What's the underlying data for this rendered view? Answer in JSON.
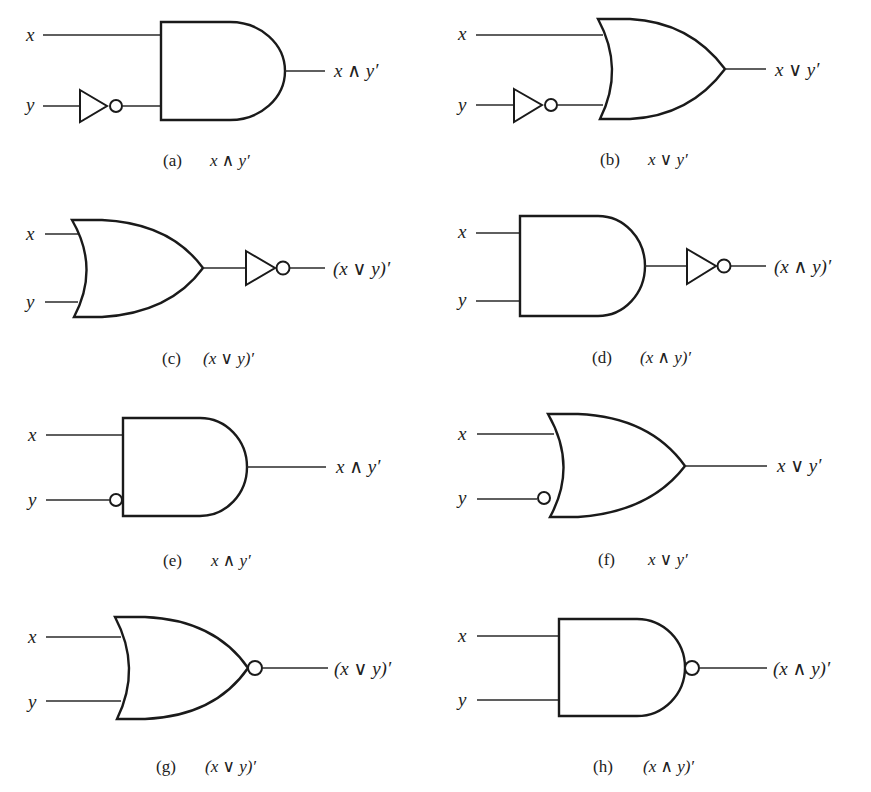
{
  "figure": {
    "panels": [
      {
        "id": "a",
        "tag": "(a)",
        "input_x": "x",
        "input_y": "y",
        "gate": "AND",
        "inverted_inputs": [
          "y (separate inverter)"
        ],
        "output_label": "x ∧ y′",
        "caption_expr": "x ∧ y′"
      },
      {
        "id": "b",
        "tag": "(b)",
        "input_x": "x",
        "input_y": "y",
        "gate": "OR",
        "inverted_inputs": [
          "y (separate inverter)"
        ],
        "output_label": "x ∨ y′",
        "caption_expr": "x ∨ y′"
      },
      {
        "id": "c",
        "tag": "(c)",
        "input_x": "x",
        "input_y": "y",
        "gate": "OR",
        "inverted_output": "separate inverter",
        "output_label": "(x ∨ y)′",
        "caption_expr": "(x ∨ y)′"
      },
      {
        "id": "d",
        "tag": "(d)",
        "input_x": "x",
        "input_y": "y",
        "gate": "AND",
        "inverted_output": "separate inverter",
        "output_label": "(x ∧ y)′",
        "caption_expr": "(x ∧ y)′"
      },
      {
        "id": "e",
        "tag": "(e)",
        "input_x": "x",
        "input_y": "y",
        "gate": "AND",
        "inverted_inputs": [
          "y (bubble)"
        ],
        "output_label": "x ∧ y′",
        "caption_expr": "x ∧ y′"
      },
      {
        "id": "f",
        "tag": "(f)",
        "input_x": "x",
        "input_y": "y",
        "gate": "OR",
        "inverted_inputs": [
          "y (bubble)"
        ],
        "output_label": "x ∨ y′",
        "caption_expr": "x ∨ y′"
      },
      {
        "id": "g",
        "tag": "(g)",
        "input_x": "x",
        "input_y": "y",
        "gate": "NOR",
        "inverted_output": "bubble",
        "output_label": "(x ∨ y)′",
        "caption_expr": "(x ∨ y)′"
      },
      {
        "id": "h",
        "tag": "(h)",
        "input_x": "x",
        "input_y": "y",
        "gate": "NAND",
        "inverted_output": "bubble",
        "output_label": "(x ∧ y)′",
        "caption_expr": "(x ∧ y)′"
      }
    ]
  }
}
